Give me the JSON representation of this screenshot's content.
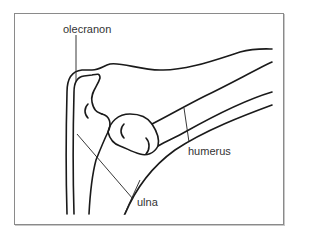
{
  "diagram": {
    "labels": {
      "olecranon": "olecranon",
      "humerus": "humerus",
      "ulna": "ulna"
    },
    "colors": {
      "line": "#1a1a1a",
      "frame": "#8a8a8a",
      "text": "#333333",
      "background": "#ffffff"
    }
  }
}
